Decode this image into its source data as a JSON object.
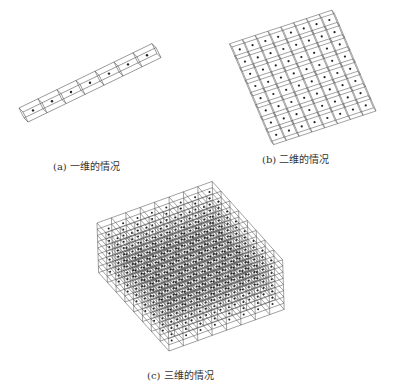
{
  "figure": {
    "panels": [
      {
        "id": "a",
        "caption": "(a) 一维的情况",
        "grid": [
          7,
          1,
          1
        ],
        "description": "1D row of cells with one point each"
      },
      {
        "id": "b",
        "caption": "(b) 二维的情况",
        "grid": [
          8,
          8,
          1
        ],
        "description": "2D grid of cells with one point each"
      },
      {
        "id": "c",
        "caption": "(c)  三维的情况",
        "grid": [
          8,
          8,
          8
        ],
        "description": "3D lattice of cells with one point each"
      }
    ],
    "colors": {
      "line": "#555555",
      "dot": "#222222",
      "background": "#ffffff"
    }
  }
}
